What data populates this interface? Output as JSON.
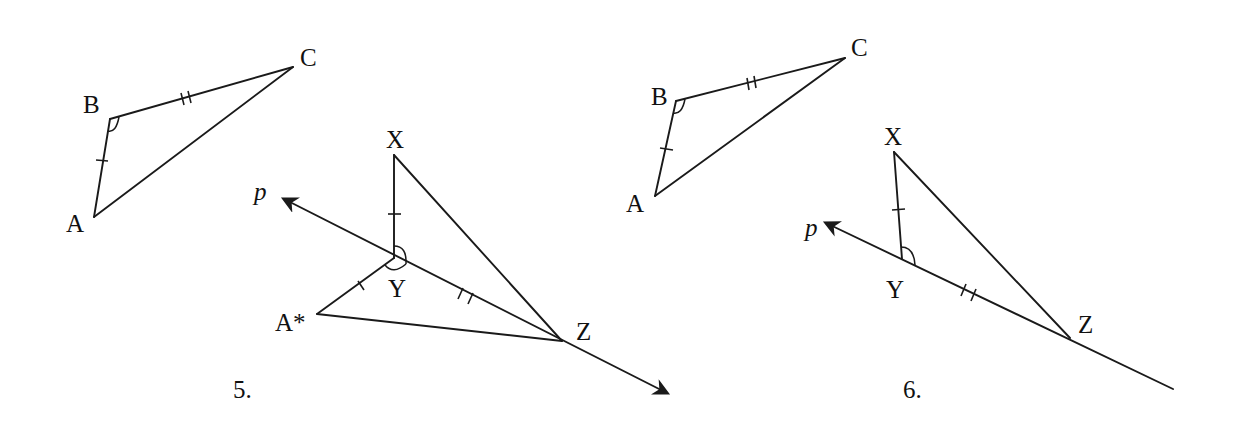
{
  "figures": [
    {
      "number": "5.",
      "triangle_abc": {
        "labels": {
          "A": "A",
          "B": "B",
          "C": "C"
        },
        "points": {
          "A": [
            94,
            217
          ],
          "B": [
            110,
            119
          ],
          "C": [
            293,
            67
          ]
        }
      },
      "triangle_xyz": {
        "labels": {
          "X": "X",
          "Y": "Y",
          "Z": "Z",
          "A_star": "A*"
        },
        "points": {
          "X": [
            394,
            155
          ],
          "Y": [
            394,
            258
          ],
          "Z": [
            562,
            341
          ],
          "A_star": [
            317,
            314
          ]
        }
      },
      "line_p": {
        "label": "p",
        "tip": [
          284,
          199
        ],
        "end": [
          667,
          393
        ],
        "arrow_both": true
      }
    },
    {
      "number": "6.",
      "triangle_abc": {
        "labels": {
          "A": "A",
          "B": "B",
          "C": "C"
        },
        "points": {
          "A": [
            655,
            196
          ],
          "B": [
            676,
            101
          ],
          "C": [
            845,
            58
          ]
        }
      },
      "triangle_xyz": {
        "labels": {
          "X": "X",
          "Y": "Y",
          "Z": "Z"
        },
        "points": {
          "X": [
            894,
            152
          ],
          "Y": [
            902,
            259
          ],
          "Z": [
            1070,
            338
          ]
        }
      },
      "line_p": {
        "label": "p",
        "tip": [
          826,
          223
        ],
        "end": [
          1173,
          389
        ],
        "arrow_both": false
      }
    }
  ],
  "colors": {
    "stroke": "#1a1a1a",
    "text": "#111111",
    "background": "#ffffff"
  }
}
